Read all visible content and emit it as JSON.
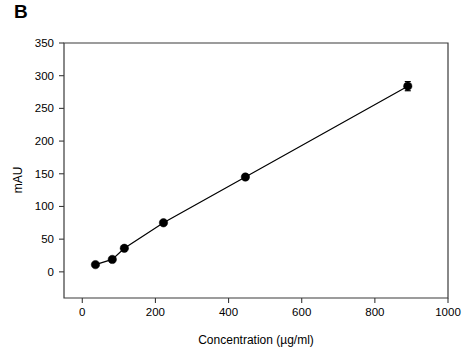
{
  "figure": {
    "panel_label": "B",
    "background_color": "#ffffff",
    "foreground_color": "#000000"
  },
  "chart_data": {
    "type": "scatter",
    "title": "",
    "subtitle": "",
    "xlabel": "Concentration (µg/ml)",
    "ylabel": "mAU",
    "xlim": [
      -50,
      1000
    ],
    "ylim": [
      -40,
      350
    ],
    "xticks": [
      0,
      200,
      400,
      600,
      800,
      1000
    ],
    "xtick_labels": [
      "0",
      "200",
      "400",
      "600",
      "800",
      "1000"
    ],
    "yticks": [
      0,
      50,
      100,
      150,
      200,
      250,
      300,
      350
    ],
    "ytick_labels": [
      "0",
      "50",
      "100",
      "150",
      "200",
      "250",
      "300",
      "350"
    ],
    "grid": false,
    "legend": null,
    "legend_position": "none",
    "marker_style": "filled-circle",
    "marker_color": "#000000",
    "line_color": "#000000",
    "connected": true,
    "series": [
      {
        "name": "calibration curve",
        "x": [
          36,
          82,
          115,
          222,
          446,
          890
        ],
        "y": [
          11,
          19,
          36,
          75,
          145,
          284
        ],
        "yerr": [
          2,
          2,
          2,
          3,
          4,
          7
        ]
      }
    ]
  }
}
